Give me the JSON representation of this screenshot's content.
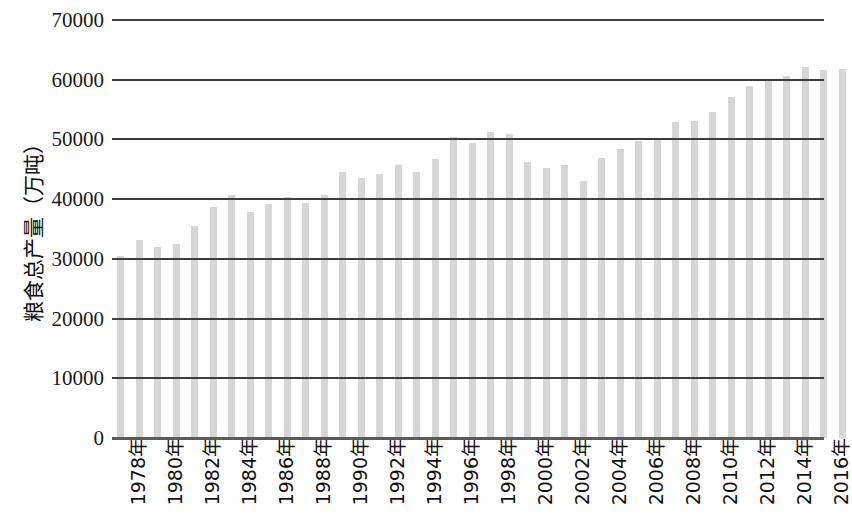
{
  "chart_data": {
    "type": "bar",
    "title": "",
    "xlabel": "",
    "ylabel": "粮食总产量（万吨）",
    "ylim": [
      0,
      70000
    ],
    "ytick_labels": [
      "70000",
      "60000",
      "50000",
      "40000",
      "30000",
      "20000",
      "10000",
      "0"
    ],
    "ytick_values": [
      70000,
      60000,
      50000,
      40000,
      30000,
      20000,
      10000,
      0
    ],
    "grid": true,
    "legend": "none",
    "xtick_suffix": "年",
    "xtick_label_step": 2,
    "xtick_labels": [
      "1978年",
      "1980年",
      "1982年",
      "1984年",
      "1986年",
      "1988年",
      "1990年",
      "1992年",
      "1994年",
      "1996年",
      "1998年",
      "2000年",
      "2002年",
      "2004年",
      "2006年",
      "2008年",
      "2010年",
      "2012年",
      "2014年",
      "2016年"
    ],
    "categories": [
      "1978年",
      "1979年",
      "1980年",
      "1981年",
      "1982年",
      "1983年",
      "1984年",
      "1985年",
      "1986年",
      "1987年",
      "1988年",
      "1989年",
      "1990年",
      "1991年",
      "1992年",
      "1993年",
      "1994年",
      "1995年",
      "1996年",
      "1997年",
      "1998年",
      "1999年",
      "2000年",
      "2001年",
      "2002年",
      "2003年",
      "2004年",
      "2005年",
      "2006年",
      "2007年",
      "2008年",
      "2009年",
      "2010年",
      "2011年",
      "2012年",
      "2013年",
      "2014年",
      "2015年",
      "2016年",
      "2017年"
    ],
    "values": [
      30477,
      33212,
      32056,
      32502,
      35450,
      38728,
      40731,
      37911,
      39151,
      40298,
      39408,
      40755,
      44624,
      43529,
      44266,
      45649,
      44510,
      46662,
      50454,
      49417,
      51230,
      50839,
      46218,
      45264,
      45706,
      43070,
      46947,
      48402,
      49804,
      50160,
      52871,
      53082,
      54648,
      57121,
      58958,
      60194,
      60703,
      62144,
      61625,
      61791
    ],
    "bar_color": "#d6d6d6",
    "gridline_color": "#3d3d3d",
    "axis_color": "#5a5a5a",
    "background": "#ffffff"
  }
}
